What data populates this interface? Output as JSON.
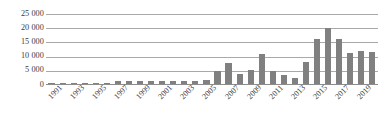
{
  "chart_data": {
    "type": "bar",
    "title": "",
    "subtitle": "",
    "xlabel": "",
    "ylabel": "",
    "ylim": [
      0,
      25000
    ],
    "ytick_values": [
      0,
      5000,
      10000,
      15000,
      20000,
      25000
    ],
    "ytick_labels": [
      "0",
      "5 000",
      "10 000",
      "15 000",
      "20 000",
      "25 000"
    ],
    "grid": true,
    "legend": false,
    "legend_position": "none",
    "bar_color": "#808080",
    "gridline_color": "#a9a9a9",
    "axis_color": "#8d8d8d",
    "text_color": "#3b3b3b",
    "tick_label_rotation": -45,
    "categories": [
      "1991",
      "1992",
      "1993",
      "1994",
      "1995",
      "1996",
      "1997",
      "1998",
      "1999",
      "2000",
      "2001",
      "2002",
      "2003",
      "2004",
      "2005",
      "2006",
      "2007",
      "2008",
      "2009",
      "2010",
      "2011",
      "2012",
      "2013",
      "2014",
      "2015",
      "2016",
      "2017",
      "2018",
      "2019",
      "2020"
    ],
    "tick_labels_shown": [
      "1991",
      "",
      "1993",
      "",
      "1995",
      "",
      "1997",
      "",
      "1999",
      "",
      "2001",
      "",
      "2003",
      "",
      "2005",
      "",
      "2007",
      "",
      "2009",
      "",
      "2011",
      "",
      "2013",
      "",
      "2015",
      "",
      "2017",
      "",
      "2019",
      ""
    ],
    "values": [
      100,
      150,
      300,
      350,
      400,
      300,
      900,
      1000,
      900,
      1000,
      1200,
      1100,
      1000,
      1200,
      1300,
      4600,
      7600,
      3600,
      5000,
      10600,
      4500,
      3100,
      2000,
      7900,
      16200,
      20000,
      16000,
      11200,
      11700,
      11500
    ],
    "series_name": ""
  }
}
